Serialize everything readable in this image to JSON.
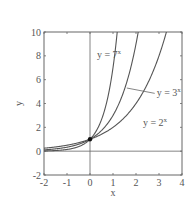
{
  "chart_data": {
    "type": "line",
    "title": "",
    "xlabel": "x",
    "ylabel": "y",
    "xlim": [
      -2,
      4
    ],
    "ylim": [
      -2,
      10
    ],
    "xticks": [
      -2,
      -1,
      0,
      1,
      2,
      3,
      4
    ],
    "yticks": [
      -2,
      0,
      2,
      4,
      6,
      8,
      10
    ],
    "grid": false,
    "series": [
      {
        "name": "y = 2^x",
        "base": 2,
        "label": "y = 2",
        "exp": "x"
      },
      {
        "name": "y = 3^x",
        "base": 3,
        "label": "y = 3",
        "exp": "x"
      },
      {
        "name": "y = 7^x",
        "base": 7,
        "label": "y = 7",
        "exp": "x"
      }
    ],
    "annotations": [
      {
        "text": "y = 7^x",
        "x": 0.3,
        "y": 7.8
      },
      {
        "text": "y = 3^x",
        "x": 2.9,
        "y": 4.6,
        "leader_to": [
          1.6,
          5.3
        ]
      },
      {
        "text": "y = 2^x",
        "x": 2.3,
        "y": 2.1
      }
    ],
    "points": [
      {
        "x": 0,
        "y": 1,
        "marker": "filled-circle"
      }
    ],
    "reference_lines": [
      {
        "type": "vertical",
        "x": 0
      },
      {
        "type": "horizontal",
        "y": 0
      }
    ]
  }
}
